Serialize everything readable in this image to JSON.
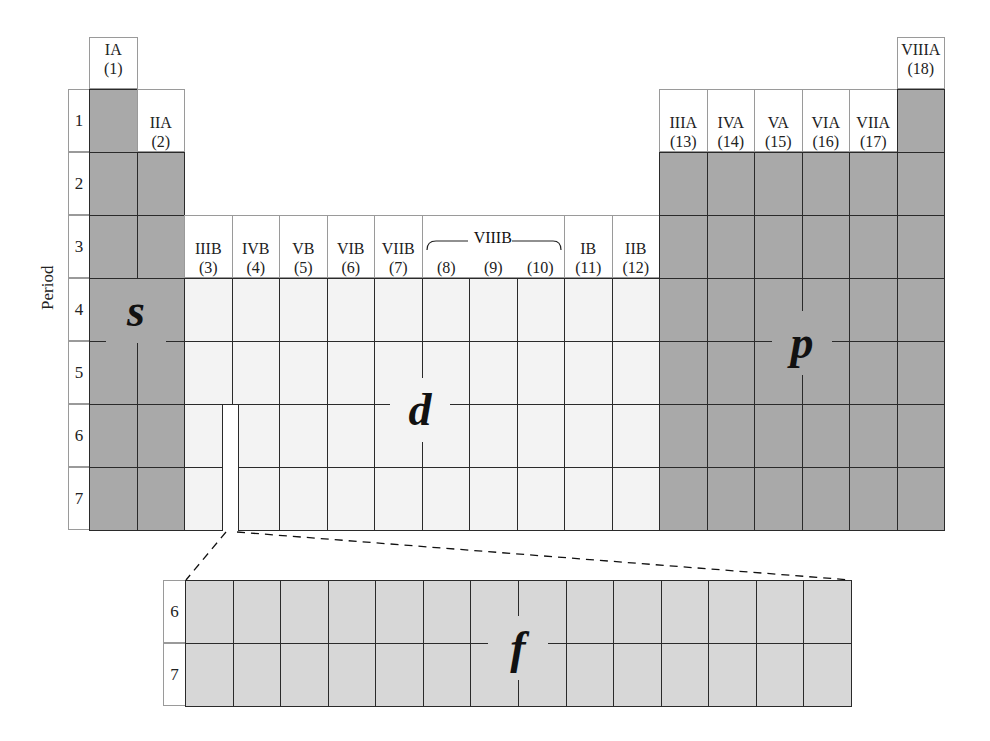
{
  "axis_label": "Period",
  "groups": [
    {
      "name": "IA",
      "num": "(1)"
    },
    {
      "name": "IIA",
      "num": "(2)"
    },
    {
      "name": "IIIB",
      "num": "(3)"
    },
    {
      "name": "IVB",
      "num": "(4)"
    },
    {
      "name": "VB",
      "num": "(5)"
    },
    {
      "name": "VIB",
      "num": "(6)"
    },
    {
      "name": "VIIB",
      "num": "(7)"
    },
    {
      "name": "",
      "num": "(8)"
    },
    {
      "name": "",
      "num": "(9)"
    },
    {
      "name": "",
      "num": "(10)"
    },
    {
      "name": "IB",
      "num": "(11)"
    },
    {
      "name": "IIB",
      "num": "(12)"
    },
    {
      "name": "IIIA",
      "num": "(13)"
    },
    {
      "name": "IVA",
      "num": "(14)"
    },
    {
      "name": "VA",
      "num": "(15)"
    },
    {
      "name": "VIA",
      "num": "(16)"
    },
    {
      "name": "VIIA",
      "num": "(17)"
    },
    {
      "name": "VIIIA",
      "num": "(18)"
    }
  ],
  "group_8_10_label": "VIIIB",
  "periods": [
    "1",
    "2",
    "3",
    "4",
    "5",
    "6",
    "7"
  ],
  "f_periods": [
    "6",
    "7"
  ],
  "blocks": {
    "s": "s",
    "p": "p",
    "d": "d",
    "f": "f"
  },
  "colors": {
    "s_block": "#a9a9a9",
    "p_block": "#a9a9a9",
    "d_block": "#f3f3f3",
    "f_block": "#d7d7d7"
  }
}
